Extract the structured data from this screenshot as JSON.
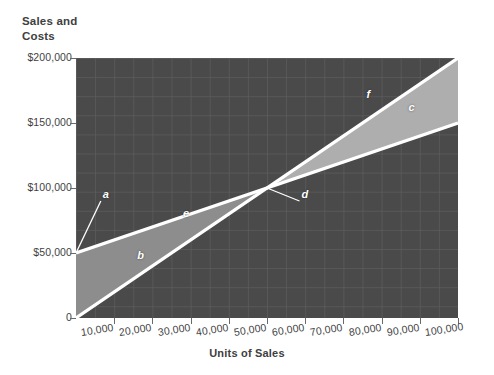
{
  "chart_data": {
    "type": "line",
    "title": "",
    "ylabel": "Sales and Costs",
    "ylabel_line1": "Sales and",
    "ylabel_line2": "Costs",
    "xlabel": "Units of Sales",
    "xlim": [
      0,
      100000
    ],
    "ylim": [
      0,
      200000
    ],
    "grid": true,
    "legend_position": "none",
    "x_ticks": [
      {
        "value": 10000,
        "label": "10,000"
      },
      {
        "value": 20000,
        "label": "20,000"
      },
      {
        "value": 30000,
        "label": "30,000"
      },
      {
        "value": 40000,
        "label": "40,000"
      },
      {
        "value": 50000,
        "label": "50,000"
      },
      {
        "value": 60000,
        "label": "60,000"
      },
      {
        "value": 70000,
        "label": "70,000"
      },
      {
        "value": 80000,
        "label": "80,000"
      },
      {
        "value": 90000,
        "label": "90,000"
      },
      {
        "value": 100000,
        "label": "100,000"
      }
    ],
    "y_ticks": [
      {
        "value": 0,
        "label": "0"
      },
      {
        "value": 50000,
        "label": "$50,000"
      },
      {
        "value": 100000,
        "label": "$100,000"
      },
      {
        "value": 150000,
        "label": "$150,000"
      },
      {
        "value": 200000,
        "label": "$200,000"
      }
    ],
    "series": [
      {
        "name": "Sales",
        "marker_label": "f",
        "color": "#ffffff",
        "points": [
          [
            0,
            0
          ],
          [
            100000,
            200000
          ]
        ]
      },
      {
        "name": "Total Costs",
        "marker_label": "e",
        "color": "#ffffff",
        "points": [
          [
            0,
            50000
          ],
          [
            100000,
            150000
          ]
        ]
      }
    ],
    "regions": [
      {
        "name": "loss-area",
        "label": "b",
        "color": "#8d8d8d"
      },
      {
        "name": "profit-area",
        "label": "c",
        "color": "#aeaeae"
      }
    ],
    "annotations": [
      {
        "key": "a",
        "label": "a",
        "x": 6500,
        "y": 90000,
        "leader_to_x": 0,
        "leader_to_y": 50000
      },
      {
        "key": "b",
        "label": "b",
        "x": 15500,
        "y": 43000
      },
      {
        "key": "c",
        "label": "c",
        "x": 86500,
        "y": 157000
      },
      {
        "key": "d",
        "label": "d",
        "x": 58500,
        "y": 90000,
        "leader_to_x": 50000,
        "leader_to_y": 100000
      },
      {
        "key": "e",
        "label": "e",
        "x": 27500,
        "y": 75500
      },
      {
        "key": "f",
        "label": "f",
        "x": 75500,
        "y": 167000
      }
    ],
    "breakeven": {
      "units": 50000,
      "dollars": 100000
    },
    "colors": {
      "plot_background": "#4a4a4a",
      "grid_line": "#5e5e5e",
      "line": "#ffffff",
      "loss_region": "#8d8d8d",
      "profit_region": "#aeaeae",
      "text": "#3f3f3f"
    }
  }
}
